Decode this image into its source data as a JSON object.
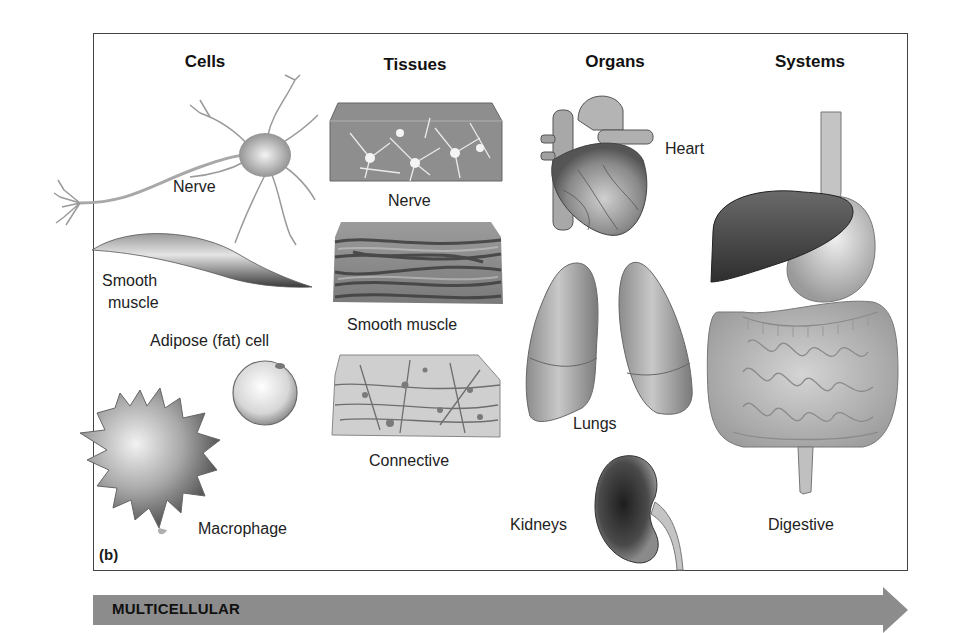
{
  "figure": {
    "panel_label": "(b)",
    "columns": [
      {
        "id": "cells",
        "header": "Cells",
        "items": [
          {
            "label": "Nerve"
          },
          {
            "label_lines": [
              "Smooth",
              "muscle"
            ]
          },
          {
            "label": "Adipose (fat) cell"
          },
          {
            "label": "Macrophage"
          }
        ]
      },
      {
        "id": "tissues",
        "header": "Tissues",
        "items": [
          {
            "label": "Nerve"
          },
          {
            "label": "Smooth muscle"
          },
          {
            "label": "Connective"
          }
        ]
      },
      {
        "id": "organs",
        "header": "Organs",
        "items": [
          {
            "label": "Heart"
          },
          {
            "label": "Lungs"
          },
          {
            "label": "Kidneys"
          }
        ]
      },
      {
        "id": "systems",
        "header": "Systems",
        "items": [
          {
            "label": "Digestive"
          }
        ]
      }
    ],
    "progression_arrow": {
      "label": "MULTICELLULAR",
      "color": "#8c8c8c"
    },
    "colors": {
      "frame": "#444444",
      "illustration_dark": "#3a3a3a",
      "illustration_mid": "#8a8a8a",
      "illustration_light": "#d8d8d8"
    }
  }
}
